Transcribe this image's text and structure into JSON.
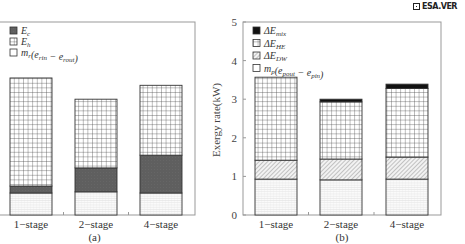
{
  "watermark": {
    "text": "ESA.VER"
  },
  "shared": {
    "ylabel": "Exergy rate(kW)",
    "y_ticks": [
      "0",
      "1",
      "2",
      "3",
      "4",
      "5"
    ],
    "categories": [
      "1-stage",
      "2-stage",
      "4-stage"
    ]
  },
  "panel_a": {
    "label": "(a)",
    "legend": [
      {
        "key": "Ec",
        "text": "Ec",
        "pattern": "dark-gray"
      },
      {
        "key": "Eh",
        "text": "Eh",
        "pattern": "grid"
      },
      {
        "key": "base",
        "text": "m(e_rin − e_rout)",
        "pattern": "light-lines"
      }
    ]
  },
  "panel_b": {
    "label": "(b)",
    "legend": [
      {
        "key": "mix",
        "text": "ΔE_mix",
        "pattern": "black"
      },
      {
        "key": "HE",
        "text": "ΔE_HE",
        "pattern": "grid"
      },
      {
        "key": "DW",
        "text": "ΔE_DW",
        "pattern": "diagonal-hatch"
      },
      {
        "key": "base",
        "text": "m_p(e_pout − e_pin)",
        "pattern": "light-lines"
      }
    ]
  },
  "chart_data": [
    {
      "type": "bar",
      "stacked": true,
      "title": "(a)",
      "xlabel": "",
      "ylabel": "Exergy rate(kW)",
      "ylim": [
        0,
        5
      ],
      "categories": [
        "1-stage",
        "2-stage",
        "4-stage"
      ],
      "series": [
        {
          "name": "m(e_rin − e_rout)",
          "values": [
            0.57,
            0.6,
            0.57
          ]
        },
        {
          "name": "Ec",
          "values": [
            0.18,
            0.62,
            0.98
          ]
        },
        {
          "name": "Eh",
          "values": [
            2.8,
            1.78,
            1.81
          ]
        }
      ],
      "totals": [
        3.55,
        3.0,
        3.36
      ],
      "legend_position": "upper left",
      "grid": false
    },
    {
      "type": "bar",
      "stacked": true,
      "title": "(b)",
      "xlabel": "",
      "ylabel": "Exergy rate(kW)",
      "ylim": [
        0,
        5
      ],
      "y_ticks": [
        0,
        1,
        2,
        3,
        4,
        5
      ],
      "categories": [
        "1-stage",
        "2-stage",
        "4-stage"
      ],
      "series": [
        {
          "name": "m_p(e_pout − e_pin)",
          "values": [
            0.93,
            0.91,
            0.93
          ]
        },
        {
          "name": "ΔE_DW",
          "values": [
            0.49,
            0.54,
            0.57
          ]
        },
        {
          "name": "ΔE_HE",
          "values": [
            2.15,
            1.48,
            1.78
          ]
        },
        {
          "name": "ΔE_mix",
          "values": [
            0.0,
            0.07,
            0.11
          ]
        }
      ],
      "totals": [
        3.57,
        3.0,
        3.39
      ],
      "legend_position": "upper left",
      "grid": false
    }
  ]
}
